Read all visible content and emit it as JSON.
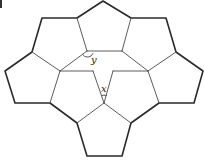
{
  "figure": {
    "labels": {
      "x": "x",
      "y": "y"
    },
    "colors": {
      "line": "#2a2a2a",
      "background": "#ffffff"
    },
    "pentagon_count": 7
  }
}
